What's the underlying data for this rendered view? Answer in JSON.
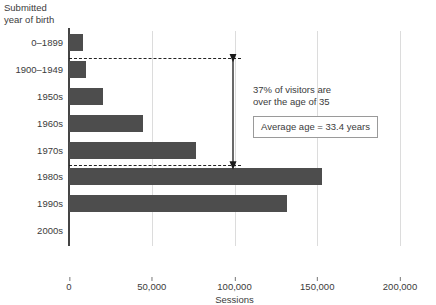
{
  "chart_data": {
    "type": "bar",
    "orientation": "horizontal",
    "title": "",
    "ylabel": "Submitted\nyear of birth",
    "xlabel": "Sessions",
    "categories": [
      "0–1899",
      "1900–1949",
      "1950s",
      "1960s",
      "1970s",
      "1980s",
      "1990s",
      "2000s"
    ],
    "values": [
      8500,
      10000,
      20500,
      45000,
      77000,
      153000,
      132000,
      0
    ],
    "xlim": [
      0,
      200000
    ],
    "xticks": [
      0,
      50000,
      100000,
      150000,
      200000
    ],
    "xtick_labels": [
      "0",
      "50,000",
      "100,000",
      "150,000",
      "200,000"
    ],
    "grid": "vertical",
    "legend": "none",
    "bar_color": "#4d4d4d",
    "annotations": [
      {
        "name": "percent-over-35",
        "text": "37% of visitors are\nover the age of 35"
      },
      {
        "name": "average-age-box",
        "text": "Average age = 33.4 years"
      }
    ]
  },
  "axis": {
    "y_title": "Submitted\nyear of birth",
    "x_title": "Sessions"
  },
  "ticks": {
    "x": [
      {
        "label": "0",
        "value": 0
      },
      {
        "label": "50,000",
        "value": 50000
      },
      {
        "label": "100,000",
        "value": 100000
      },
      {
        "label": "150,000",
        "value": 150000
      },
      {
        "label": "200,000",
        "value": 200000
      }
    ]
  },
  "bars": [
    {
      "label": "0–1899",
      "value": 8500
    },
    {
      "label": "1900–1949",
      "value": 10000
    },
    {
      "label": "1950s",
      "value": 20500
    },
    {
      "label": "1960s",
      "value": 45000
    },
    {
      "label": "1970s",
      "value": 77000
    },
    {
      "label": "1980s",
      "value": 153000
    },
    {
      "label": "1990s",
      "value": 132000
    },
    {
      "label": "2000s",
      "value": 0
    }
  ],
  "annotations": {
    "note": "37% of visitors are\nover the age of 35",
    "boxed_stat": "Average age = 33.4 years"
  },
  "colors": {
    "bar": "#4d4d4d",
    "grid": "#dcdcdc",
    "axis": "#444444",
    "text": "#3b3b3b",
    "refline": "#222222"
  }
}
